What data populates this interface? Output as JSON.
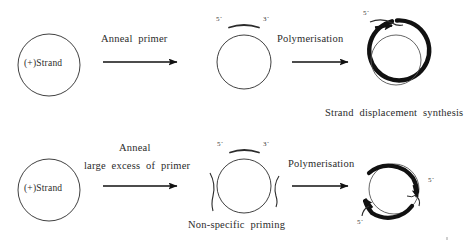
{
  "figure": {
    "title_text": "",
    "background_color": "#ffffff",
    "ink_color": "#1a1a1a"
  },
  "rows": [
    {
      "id": "row-1",
      "start": {
        "shape": "circle",
        "label": "(+)Strand"
      },
      "step": {
        "label_lines": [
          "Anneal  primer"
        ],
        "arrow": "right-arrow"
      },
      "middle": {
        "shape": "circle-with-primer",
        "primer_five_prime": "5´",
        "primer_three_prime": "3´",
        "caption": ""
      },
      "step2": {
        "label_lines": [
          "Polymerisation"
        ],
        "arrow": "right-arrow"
      },
      "end": {
        "shape": "circle-double-ring-with-arrow",
        "five_prime": "5´",
        "caption": "Strand  displacement  synthesis"
      }
    },
    {
      "id": "row-2",
      "start": {
        "shape": "circle",
        "label": "(+)Strand"
      },
      "step": {
        "label_lines": [
          "Anneal",
          "large  excess  of  primer"
        ],
        "arrow": "right-arrow"
      },
      "middle": {
        "shape": "circle-with-multiple-primers",
        "primer_five_prime": "5´",
        "primer_three_prime": "3´",
        "caption": "Non-specific  priming"
      },
      "step2": {
        "label_lines": [
          "Polymerisation"
        ],
        "arrow": "right-arrow"
      },
      "end": {
        "shape": "circle-multi-arc-with-arrows",
        "five_prime_right": "5´",
        "five_prime_left": "5´",
        "caption": ""
      }
    }
  ]
}
